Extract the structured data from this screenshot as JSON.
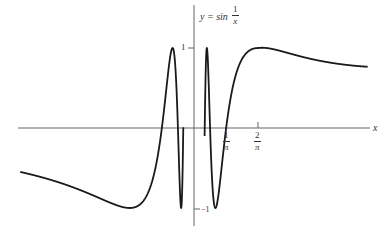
{
  "chart_data": {
    "type": "line",
    "function": "sin(1/x)",
    "xlabel": "x",
    "ylabel": "y",
    "x_ticks": [
      {
        "value": 0.3183,
        "label_num": "1",
        "label_den": "π"
      },
      {
        "value": 0.6366,
        "label_num": "2",
        "label_den": "π"
      }
    ],
    "y_ticks": [
      {
        "value": 1,
        "label": "1"
      },
      {
        "value": -1,
        "label": "−1"
      }
    ],
    "xlim": [
      -1.7,
      1.7
    ],
    "ylim": [
      -1.1,
      1.1
    ],
    "grid": false,
    "legend": null,
    "series": [
      {
        "name": "sin(1/x)",
        "color": "#1a1a1a",
        "note": "oscillates infinitely between -1 and 1 near x = 0; peak at x = 2/π"
      }
    ]
  },
  "labels": {
    "title_lhs": "y = sin",
    "title_num": "1",
    "title_den": "x",
    "x_axis": "x",
    "y_tick_pos": "1",
    "y_tick_neg": "−1",
    "xtick1_num": "1",
    "xtick1_den": "π",
    "xtick2_num": "2",
    "xtick2_den": "π"
  },
  "colors": {
    "curve": "#1a1a1a",
    "axes": "#555555",
    "text": "#333333"
  }
}
